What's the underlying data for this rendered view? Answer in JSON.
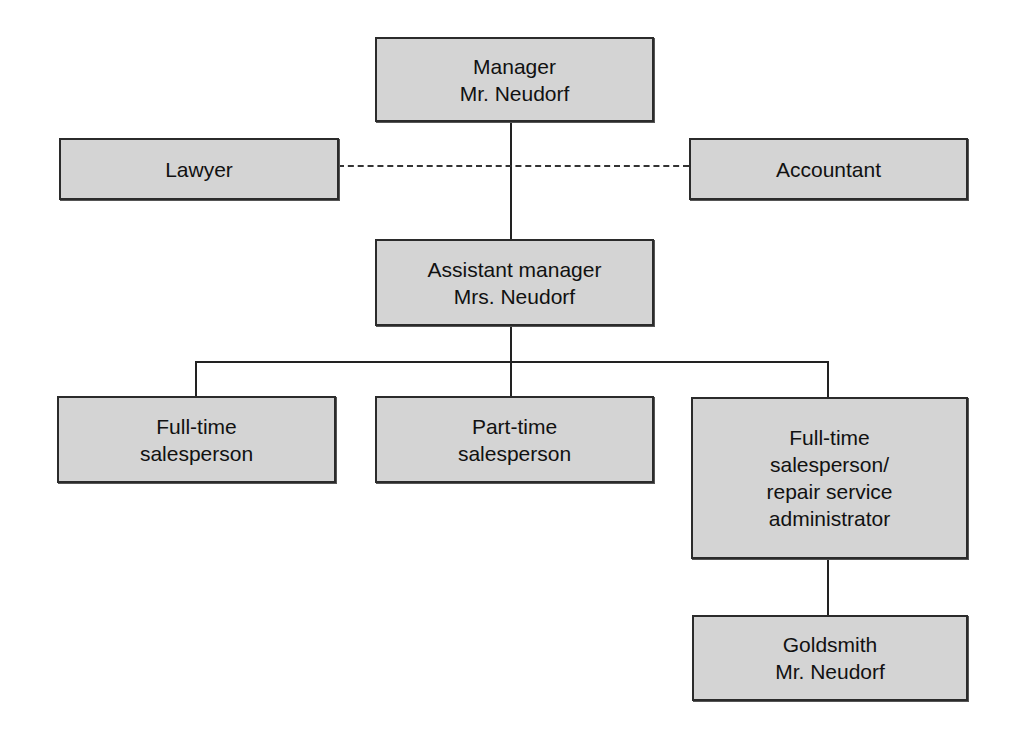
{
  "chart": {
    "nodes": {
      "manager": {
        "lines": [
          "Manager",
          "Mr. Neudorf"
        ]
      },
      "lawyer": {
        "lines": [
          "Lawyer"
        ]
      },
      "accountant": {
        "lines": [
          "Accountant"
        ]
      },
      "assistant_manager": {
        "lines": [
          "Assistant manager",
          "Mrs. Neudorf"
        ]
      },
      "full_time_salesperson": {
        "lines": [
          "Full-time",
          "salesperson"
        ]
      },
      "part_time_salesperson": {
        "lines": [
          "Part-time",
          "salesperson"
        ]
      },
      "full_time_repair": {
        "lines": [
          "Full-time",
          "salesperson/",
          "repair service",
          "administrator"
        ]
      },
      "goldsmith": {
        "lines": [
          "Goldsmith",
          "Mr. Neudorf"
        ]
      }
    },
    "edges": [
      {
        "from": "manager",
        "to": "assistant_manager",
        "style": "solid"
      },
      {
        "from": "manager",
        "to": "lawyer",
        "style": "dashed"
      },
      {
        "from": "manager",
        "to": "accountant",
        "style": "dashed"
      },
      {
        "from": "assistant_manager",
        "to": "full_time_salesperson",
        "style": "solid"
      },
      {
        "from": "assistant_manager",
        "to": "part_time_salesperson",
        "style": "solid"
      },
      {
        "from": "assistant_manager",
        "to": "full_time_repair",
        "style": "solid"
      },
      {
        "from": "full_time_repair",
        "to": "goldsmith",
        "style": "solid"
      }
    ],
    "colors": {
      "box_fill": "#d4d4d4",
      "border": "#2b2b2b",
      "line": "#222222"
    }
  }
}
